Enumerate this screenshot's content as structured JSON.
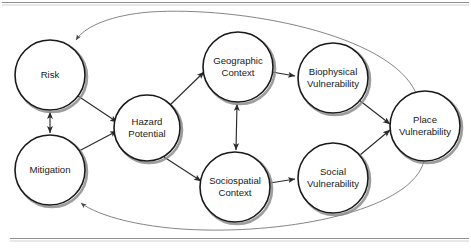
{
  "figure": {
    "type": "concept-diagram",
    "title": "",
    "background_color": "#ffffff",
    "node_fill": "#ffffff",
    "node_stroke": "#1a1a1a",
    "node_shadow_color": "#8c8c8c",
    "edge_color": "#2b2b2b",
    "feedback_edge_color": "#6f6f6f",
    "frame_rule_color": "#8f8f8f",
    "width": 471,
    "height": 252
  },
  "nodes": [
    {
      "id": "risk",
      "label_line1": "Risk",
      "label_line2": "",
      "cx": 50,
      "cy": 75,
      "r": 35
    },
    {
      "id": "mitigation",
      "label_line1": "Mitigation",
      "label_line2": "",
      "cx": 50,
      "cy": 170,
      "r": 35
    },
    {
      "id": "hazard",
      "label_line1": "Hazard",
      "label_line2": "Potential",
      "cx": 147,
      "cy": 128,
      "r": 33
    },
    {
      "id": "geographic",
      "label_line1": "Geographic",
      "label_line2": "Context",
      "cx": 238,
      "cy": 67,
      "r": 35
    },
    {
      "id": "biophysical",
      "label_line1": "Biophysical",
      "label_line2": "Vulnerability",
      "cx": 333,
      "cy": 78,
      "r": 35
    },
    {
      "id": "sociospatial",
      "label_line1": "Sociospatial",
      "label_line2": "Context",
      "cx": 235,
      "cy": 187,
      "r": 35
    },
    {
      "id": "social",
      "label_line1": "Social",
      "label_line2": "Vulnerability",
      "cx": 333,
      "cy": 178,
      "r": 35
    },
    {
      "id": "place",
      "label_line1": "Place",
      "label_line2": "Vulnerability",
      "cx": 425,
      "cy": 126,
      "r": 35
    }
  ],
  "edges": [
    {
      "id": "risk-mitigation",
      "from": "risk",
      "to": "mitigation",
      "style": "double-arrow",
      "kind": "straight"
    },
    {
      "id": "risk-hazard",
      "from": "risk",
      "to": "hazard",
      "style": "arrow",
      "kind": "straight"
    },
    {
      "id": "mitigation-hazard",
      "from": "mitigation",
      "to": "hazard",
      "style": "arrow",
      "kind": "straight"
    },
    {
      "id": "hazard-geographic",
      "from": "hazard",
      "to": "geographic",
      "style": "arrow",
      "kind": "straight"
    },
    {
      "id": "hazard-sociospatial",
      "from": "hazard",
      "to": "sociospatial",
      "style": "arrow",
      "kind": "straight"
    },
    {
      "id": "geographic-sociospatial",
      "from": "geographic",
      "to": "sociospatial",
      "style": "double-arrow",
      "kind": "straight"
    },
    {
      "id": "geographic-biophysical",
      "from": "geographic",
      "to": "biophysical",
      "style": "arrow",
      "kind": "straight"
    },
    {
      "id": "sociospatial-social",
      "from": "sociospatial",
      "to": "social",
      "style": "arrow",
      "kind": "straight"
    },
    {
      "id": "biophysical-place",
      "from": "biophysical",
      "to": "place",
      "style": "arrow",
      "kind": "straight"
    },
    {
      "id": "social-place",
      "from": "social",
      "to": "place",
      "style": "arrow",
      "kind": "straight"
    },
    {
      "id": "place-risk-feedback",
      "from": "place",
      "to": "risk",
      "style": "arrow",
      "kind": "curve-top"
    },
    {
      "id": "place-mitigation-feedback",
      "from": "place",
      "to": "mitigation",
      "style": "arrow",
      "kind": "curve-bottom"
    }
  ],
  "frame": {
    "top_rule": true,
    "bottom_rule": true
  }
}
